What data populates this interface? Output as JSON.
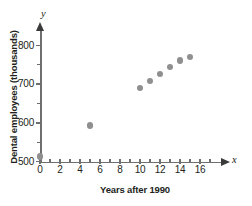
{
  "chart_data": {
    "type": "scatter",
    "title": "",
    "xlabel": "Years after 1990",
    "ylabel": "Dental employees (thousands)",
    "x_var": "x",
    "y_var": "y",
    "xlim": [
      0,
      17
    ],
    "ylim": [
      500,
      812
    ],
    "grid": false,
    "legend": null,
    "x_ticks_major": [
      0,
      2,
      4,
      6,
      8,
      10,
      12,
      14,
      16
    ],
    "x_tick_labels": [
      "0",
      "2",
      "4",
      "6",
      "8",
      "10",
      "12",
      "14",
      "16"
    ],
    "x_ticks_minor": [
      1,
      3,
      5,
      7,
      9,
      11,
      13,
      15,
      17
    ],
    "y_ticks_major": [
      500,
      600,
      700,
      800
    ],
    "y_tick_labels": [
      "500",
      "600",
      "700",
      "800"
    ],
    "y_ticks_minor": [
      550,
      650,
      750
    ],
    "point_color": "#8f8f8f",
    "axis_color": "#6f6f6f",
    "points": [
      {
        "x": 0,
        "y": 513
      },
      {
        "x": 5,
        "y": 593
      },
      {
        "x": 10,
        "y": 690
      },
      {
        "x": 11,
        "y": 708
      },
      {
        "x": 12,
        "y": 727
      },
      {
        "x": 13,
        "y": 745
      },
      {
        "x": 14,
        "y": 761
      },
      {
        "x": 15,
        "y": 771
      }
    ]
  }
}
